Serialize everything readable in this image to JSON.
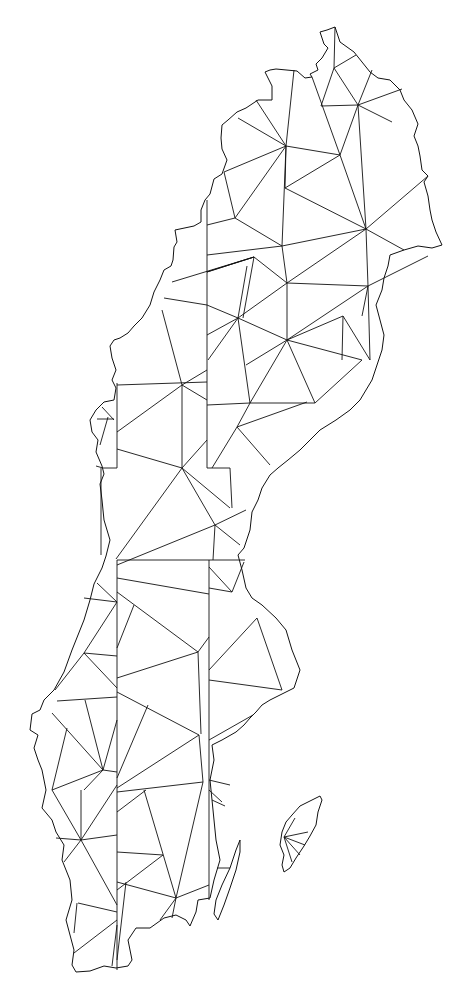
{
  "map": {
    "subject": "Sweden triangulation mesh",
    "background": "#ffffff",
    "stroke_color": "#111111",
    "regions": [
      "mainland",
      "oland",
      "gotland"
    ],
    "labels": []
  }
}
